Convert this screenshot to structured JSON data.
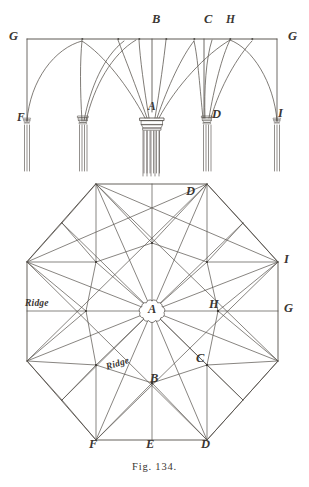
{
  "figure": {
    "caption": "Fig. 134.",
    "ink_color": "#3a3632",
    "line_color": "#55504a",
    "paper_color": "#ffffff"
  },
  "elevation": {
    "name": "vault-elevation",
    "labels": [
      {
        "id": "G-left",
        "text": "G",
        "x": 9,
        "y": 30,
        "size": "big"
      },
      {
        "id": "B",
        "text": "B",
        "x": 152,
        "y": 13,
        "size": "big"
      },
      {
        "id": "C",
        "text": "C",
        "x": 204,
        "y": 13,
        "size": "big"
      },
      {
        "id": "H",
        "text": "H",
        "x": 226,
        "y": 14,
        "size": "mid"
      },
      {
        "id": "G-right",
        "text": "G",
        "x": 288,
        "y": 30,
        "size": "big"
      },
      {
        "id": "A",
        "text": "A",
        "x": 148,
        "y": 101,
        "size": "mid"
      },
      {
        "id": "D",
        "text": "D",
        "x": 212,
        "y": 108,
        "size": "big"
      },
      {
        "id": "I",
        "text": "I",
        "x": 278,
        "y": 107,
        "size": "big"
      },
      {
        "id": "F",
        "text": "F",
        "x": 17,
        "y": 112,
        "size": "mid"
      }
    ],
    "springing_line_y": 39,
    "capital_line_y": 121,
    "pier_positions_x": [
      27,
      82,
      152,
      207,
      277
    ]
  },
  "plan": {
    "name": "octagonal-vault-plan",
    "centre_label": "A",
    "labels": [
      {
        "id": "D-top",
        "text": "D",
        "x": 186,
        "y": 185,
        "size": "big"
      },
      {
        "id": "I-right",
        "text": "I",
        "x": 284,
        "y": 253,
        "size": "big"
      },
      {
        "id": "G-right",
        "text": "G",
        "x": 284,
        "y": 302,
        "size": "big"
      },
      {
        "id": "H",
        "text": "H",
        "x": 209,
        "y": 298,
        "size": "big"
      },
      {
        "id": "A-centre",
        "text": "A",
        "x": 148,
        "y": 303,
        "size": "big"
      },
      {
        "id": "C",
        "text": "C",
        "x": 196,
        "y": 352,
        "size": "big"
      },
      {
        "id": "B",
        "text": "B",
        "x": 150,
        "y": 372,
        "size": "big"
      },
      {
        "id": "F-bottom",
        "text": "F",
        "x": 89,
        "y": 438,
        "size": "big"
      },
      {
        "id": "E-bottom",
        "text": "E",
        "x": 146,
        "y": 438,
        "size": "big"
      },
      {
        "id": "D-bottom",
        "text": "D",
        "x": 201,
        "y": 438,
        "size": "big"
      },
      {
        "id": "Ridge-left",
        "text": "Ridge",
        "x": 25,
        "y": 299,
        "size": "ridge"
      },
      {
        "id": "Ridge-lower",
        "text": "Ridge",
        "x": 105,
        "y": 363,
        "size": "ridge"
      }
    ],
    "geometry": {
      "centre": [
        152,
        311
      ],
      "octagon_vertices": [
        [
          96,
          184
        ],
        [
          207,
          184
        ],
        [
          278,
          262
        ],
        [
          278,
          361
        ],
        [
          207,
          440
        ],
        [
          96,
          440
        ],
        [
          27,
          361
        ],
        [
          27,
          262
        ]
      ]
    }
  }
}
